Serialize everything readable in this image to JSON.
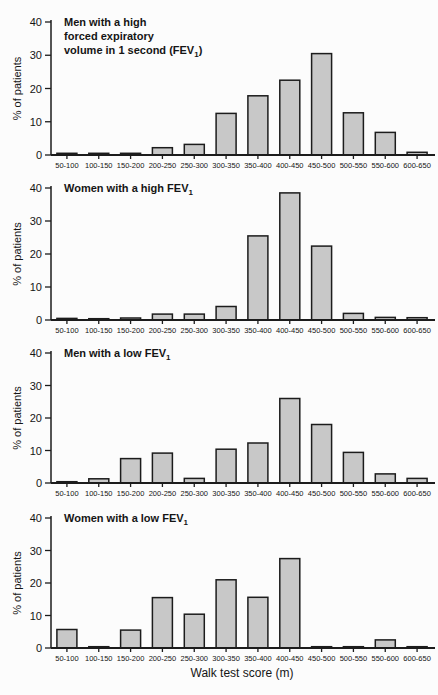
{
  "figure": {
    "background": "#fcfcfc",
    "bar_fill": "#c8c8c8",
    "bar_stroke": "#1c1c1c",
    "axis_color": "#1c1c1c",
    "shared_ylabel": "% of patients",
    "shared_xlabel": "Walk test score (m)",
    "y_ticks": [
      0,
      10,
      20,
      30,
      40
    ]
  },
  "chart_data": [
    {
      "type": "bar",
      "title": "Men with a high forced expiratory volume in 1 second (FEV1)",
      "title_lines": [
        "Men with a high",
        "forced expiratory",
        "volume in 1 second (FEV1)"
      ],
      "categories": [
        "50-100",
        "100-150",
        "150-200",
        "200-250",
        "250-300",
        "300-350",
        "350-400",
        "400-450",
        "450-500",
        "500-550",
        "550-600",
        "600-650"
      ],
      "values": [
        0.5,
        0.5,
        0.5,
        2.2,
        3.2,
        12.5,
        17.8,
        22.5,
        30.5,
        12.7,
        6.8,
        0.8
      ],
      "xlabel": "",
      "ylabel": "% of patients",
      "ylim": [
        0,
        40
      ],
      "grid": false,
      "legend": false
    },
    {
      "type": "bar",
      "title": "Women with a high FEV1",
      "title_lines": [
        "Women with a high FEV1"
      ],
      "categories": [
        "50-100",
        "100-150",
        "150-200",
        "200-250",
        "250-300",
        "300-350",
        "350-400",
        "400-450",
        "450-500",
        "500-550",
        "550-600",
        "600-650"
      ],
      "values": [
        0.5,
        0.4,
        0.6,
        1.8,
        1.8,
        4.1,
        25.5,
        38.5,
        22.4,
        2.0,
        0.8,
        0.7
      ],
      "xlabel": "",
      "ylabel": "% of patients",
      "ylim": [
        0,
        40
      ],
      "grid": false,
      "legend": false
    },
    {
      "type": "bar",
      "title": "Men with a low FEV1",
      "title_lines": [
        "Men with a low FEV1"
      ],
      "categories": [
        "50-100",
        "100-150",
        "150-200",
        "200-250",
        "250-300",
        "300-350",
        "350-400",
        "400-450",
        "450-500",
        "500-550",
        "550-600",
        "600-650"
      ],
      "values": [
        0.4,
        1.3,
        7.5,
        9.2,
        1.4,
        10.4,
        12.3,
        26.0,
        18.0,
        9.4,
        2.8,
        1.4
      ],
      "xlabel": "",
      "ylabel": "% of patients",
      "ylim": [
        0,
        40
      ],
      "grid": false,
      "legend": false
    },
    {
      "type": "bar",
      "title": "Women with a low FEV1",
      "title_lines": [
        "Women with a low FEV1"
      ],
      "categories": [
        "50-100",
        "100-150",
        "150-200",
        "200-250",
        "250-300",
        "300-350",
        "350-400",
        "400-450",
        "450-500",
        "500-550",
        "550-600",
        "600-650"
      ],
      "values": [
        5.7,
        0.4,
        5.5,
        15.5,
        10.4,
        21.0,
        15.6,
        27.5,
        0.4,
        0.4,
        2.5,
        0.4
      ],
      "xlabel": "Walk test score (m)",
      "ylabel": "% of patients",
      "ylim": [
        0,
        40
      ],
      "grid": false,
      "legend": false
    }
  ]
}
